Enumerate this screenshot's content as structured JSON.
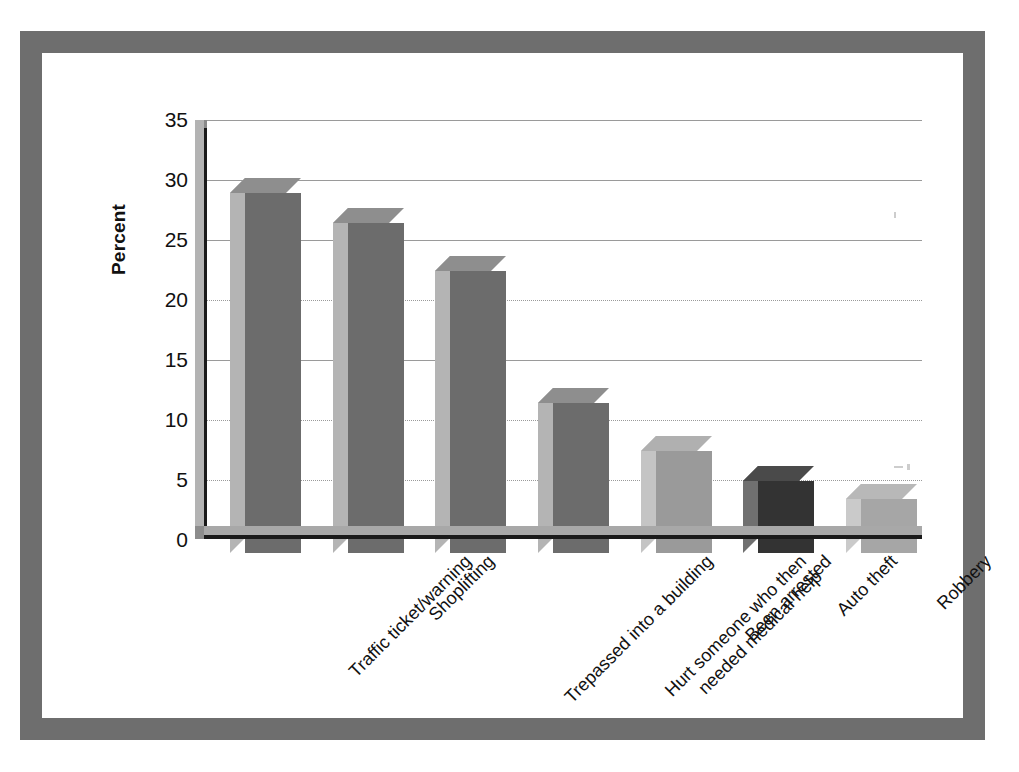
{
  "chart_data": {
    "type": "bar",
    "title": "",
    "subtitle": "",
    "xlabel": "",
    "ylabel": "Percent",
    "ylim": [
      0,
      35
    ],
    "ytick_step": 5,
    "yticks": [
      35,
      30,
      25,
      20,
      15,
      10,
      5,
      0
    ],
    "grid": true,
    "legend": "none",
    "style": "3d-bar",
    "categories": [
      "Traffic ticket/warning",
      "Shoplifting",
      "Trepassed into a building",
      "Hurt someone who then needed medical help",
      "Been arrested",
      "Auto theft",
      "Robbery"
    ],
    "values": [
      30,
      27.5,
      23.5,
      12.5,
      8.5,
      6,
      4.5
    ],
    "bar_colors": [
      "#6c6c6c",
      "#6c6c6c",
      "#6c6c6c",
      "#6c6c6c",
      "#9a9a9a",
      "#333333",
      "#a6a6a6"
    ],
    "bars": [
      {
        "label_line1": "Traffic ticket/warning",
        "label_line2": "",
        "value": 30,
        "front": "#6c6c6c",
        "side": "#b4b4b4",
        "top": "#8e8e8e"
      },
      {
        "label_line1": "Shoplifting",
        "label_line2": "",
        "value": 27.5,
        "front": "#6c6c6c",
        "side": "#b4b4b4",
        "top": "#8e8e8e"
      },
      {
        "label_line1": "Trepassed into a building",
        "label_line2": "",
        "value": 23.5,
        "front": "#6c6c6c",
        "side": "#b4b4b4",
        "top": "#8e8e8e"
      },
      {
        "label_line1": "Hurt someone who then",
        "label_line2": "needed medical help",
        "value": 12.5,
        "front": "#6c6c6c",
        "side": "#b4b4b4",
        "top": "#8e8e8e"
      },
      {
        "label_line1": "Been arrested",
        "label_line2": "",
        "value": 8.5,
        "front": "#9a9a9a",
        "side": "#c4c4c4",
        "top": "#b0b0b0"
      },
      {
        "label_line1": "Auto theft",
        "label_line2": "",
        "value": 6,
        "front": "#333333",
        "side": "#707070",
        "top": "#4a4a4a"
      },
      {
        "label_line1": "Robbery",
        "label_line2": "",
        "value": 4.5,
        "front": "#a6a6a6",
        "side": "#cacaca",
        "top": "#b8b8b8"
      }
    ]
  },
  "axis": {
    "y_title": "Percent",
    "tick_35": "35",
    "tick_30": "30",
    "tick_25": "25",
    "tick_20": "20",
    "tick_15": "15",
    "tick_10": "10",
    "tick_5": "5",
    "tick_0": "0"
  },
  "colors": {
    "frame": "#6e6e6e",
    "panel": "#ffffff",
    "gridline": "#9a9a9a",
    "axis": "#1a1a1a",
    "floor": "#a8a8a8",
    "text": "#111111"
  }
}
